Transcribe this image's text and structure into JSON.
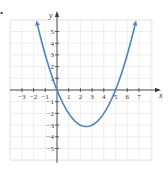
{
  "marker": "•",
  "colors": {
    "curve": "#4a86c5",
    "axis": "#3a3a3a",
    "grid": "#e2e2e2",
    "text": "#333333"
  },
  "chart_data": {
    "type": "line",
    "title": "",
    "xlabel": "x",
    "ylabel": "y",
    "xlim": [
      -3.5,
      7.9
    ],
    "ylim": [
      -6,
      6
    ],
    "grid": true,
    "x_ticks": [
      -3,
      -2,
      -1,
      1,
      2,
      3,
      4,
      5,
      6,
      7
    ],
    "x_tick_labels": [
      "−3",
      "−2",
      "−1",
      "1",
      "2",
      "3",
      "4",
      "5",
      "6",
      "7"
    ],
    "y_ticks": [
      5,
      4,
      3,
      2,
      1,
      -1,
      -2,
      -3,
      -4,
      -5
    ],
    "y_tick_labels": [
      "5",
      "4",
      "3",
      "2",
      "1",
      "−1",
      "−2",
      "−3",
      "−4",
      "−5"
    ],
    "series": [
      {
        "name": "parabola",
        "equation": "y = 0.5x^2 - 2.5x",
        "x": [
          -1.7,
          -1,
          0,
          1,
          2,
          2.5,
          3,
          4,
          5,
          6,
          6.7
        ],
        "values": [
          5.7,
          3.0,
          0,
          -2.0,
          -3.0,
          -3.125,
          -3.0,
          -2.0,
          0,
          3.0,
          5.7
        ],
        "arrows_at_ends": true
      }
    ],
    "key_points": {
      "x_intercepts": [
        0,
        5
      ],
      "y_intercept": 0,
      "vertex": [
        2.5,
        -3.125
      ]
    }
  }
}
